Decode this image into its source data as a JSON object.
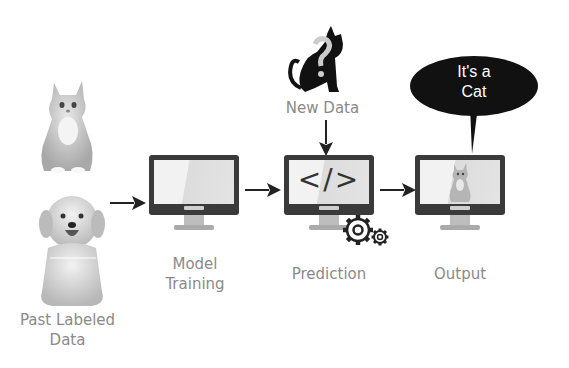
{
  "diagram": {
    "title": "",
    "nodes": [
      {
        "id": "past_labeled_data",
        "label": "Past Labeled Data",
        "images": [
          "cat-photo",
          "dog-photo"
        ]
      },
      {
        "id": "model_training",
        "label": "Model Training",
        "icon": "monitor-icon"
      },
      {
        "id": "new_data",
        "label": "New Data",
        "icon": "cat-question-icon"
      },
      {
        "id": "prediction",
        "label": "Prediction",
        "icon": "monitor-code-icon",
        "screen_text": "</>"
      },
      {
        "id": "output",
        "label": "Output",
        "icon": "monitor-cat-icon"
      }
    ],
    "edges": [
      {
        "from": "past_labeled_data",
        "to": "model_training"
      },
      {
        "from": "model_training",
        "to": "prediction"
      },
      {
        "from": "new_data",
        "to": "prediction"
      },
      {
        "from": "prediction",
        "to": "output"
      }
    ],
    "speech_bubble": {
      "line1": "It's a",
      "line2": "Cat"
    },
    "labels": {
      "past_line1": "Past Labeled",
      "past_line2": "Data",
      "model_line1": "Model",
      "model_line2": "Training",
      "new_data": "New Data",
      "prediction": "Prediction",
      "output": "Output",
      "code": "</>"
    },
    "colors": {
      "label": "#8a8a8a",
      "dark": "#222222",
      "screen": "#3a3a3a"
    }
  }
}
